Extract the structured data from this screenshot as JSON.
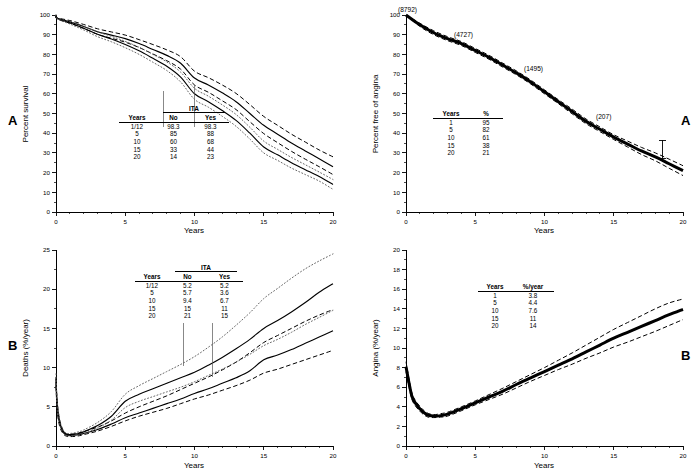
{
  "figure": {
    "panels": [
      {
        "id": "top-left",
        "letter": "A",
        "ylabel": "Percent survival",
        "xlabel": "Years",
        "table": {
          "group_header": "ITA",
          "columns": [
            "Years",
            "No",
            "Yes"
          ],
          "rows": [
            [
              "1/12",
              "98.3",
              "98.3"
            ],
            [
              "5",
              "85",
              "88"
            ],
            [
              "10",
              "60",
              "68"
            ],
            [
              "15",
              "33",
              "44"
            ],
            [
              "20",
              "14",
              "23"
            ]
          ]
        }
      },
      {
        "id": "top-right",
        "letter": "A",
        "ylabel": "Percent free of angina",
        "xlabel": "Years",
        "annotations": [
          "(8792)",
          "(4727)",
          "(1495)",
          "(207)"
        ],
        "table": {
          "columns": [
            "Years",
            "%"
          ],
          "rows": [
            [
              "1",
              "95"
            ],
            [
              "5",
              "82"
            ],
            [
              "10",
              "61"
            ],
            [
              "15",
              "38"
            ],
            [
              "20",
              "21"
            ]
          ]
        }
      },
      {
        "id": "bottom-left",
        "letter": "B",
        "ylabel": "Deaths (%/year)",
        "xlabel": "Years",
        "table": {
          "group_header": "ITA",
          "columns": [
            "Years",
            "No",
            "Yes"
          ],
          "rows": [
            [
              "1/12",
              "5.2",
              "5.2"
            ],
            [
              "5",
              "5.7",
              "3.6"
            ],
            [
              "10",
              "9.4",
              "6.7"
            ],
            [
              "15",
              "15",
              "11"
            ],
            [
              "20",
              "21",
              "15"
            ]
          ]
        }
      },
      {
        "id": "bottom-right",
        "letter": "B",
        "ylabel": "Angina (%/year)",
        "xlabel": "Years",
        "table": {
          "columns": [
            "Years",
            "%/year"
          ],
          "rows": [
            [
              "1",
              "3.8"
            ],
            [
              "5",
              "4.4"
            ],
            [
              "10",
              "7.6"
            ],
            [
              "15",
              "11"
            ],
            [
              "20",
              "14"
            ]
          ]
        }
      }
    ]
  },
  "chart_data": [
    {
      "type": "line",
      "panel": "top-left",
      "title": "",
      "xlabel": "Years",
      "ylabel": "Percent survival",
      "xlim": [
        0,
        20
      ],
      "ylim": [
        0,
        100
      ],
      "xticks": [
        0,
        5,
        10,
        15,
        20
      ],
      "yticks": [
        0,
        10,
        20,
        30,
        40,
        50,
        60,
        70,
        80,
        90,
        100
      ],
      "grid": false,
      "legend": "inset-table",
      "x": [
        0,
        0.083,
        1,
        2,
        3,
        4,
        5,
        6,
        7,
        8,
        9,
        10,
        11,
        12,
        13,
        14,
        15,
        16,
        17,
        18,
        19,
        20
      ],
      "series": [
        {
          "name": "ITA Yes (solid)",
          "style": "solid",
          "values": [
            100,
            98.3,
            96.5,
            94.2,
            91.5,
            89.8,
            88,
            85.5,
            82.5,
            79.5,
            75.5,
            68,
            64.5,
            60.5,
            56,
            50,
            44,
            39.5,
            35,
            31,
            27,
            23
          ]
        },
        {
          "name": "ITA Yes upper CL (dashed)",
          "style": "dashed",
          "values": [
            100,
            98.6,
            97.2,
            95.2,
            93,
            91.4,
            89.8,
            87.5,
            85,
            82.3,
            78.8,
            71.5,
            68.2,
            64.5,
            60.2,
            54.5,
            48.5,
            44,
            39.5,
            35.5,
            31.5,
            28
          ]
        },
        {
          "name": "ITA Yes lower CL (dashed)",
          "style": "dashed",
          "values": [
            100,
            98.0,
            95.8,
            93.2,
            90.2,
            88.2,
            86.2,
            83.5,
            80.2,
            76.8,
            72.5,
            64.5,
            60.8,
            56.5,
            52,
            45.8,
            39.8,
            35.2,
            30.8,
            26.8,
            23,
            19
          ]
        },
        {
          "name": "ITA No (solid)",
          "style": "solid",
          "values": [
            100,
            98.3,
            96.0,
            93.3,
            90.2,
            87.8,
            85,
            81.8,
            78,
            74,
            68.5,
            60,
            56,
            51.5,
            46.5,
            40,
            33,
            29,
            25,
            21.5,
            18,
            14
          ]
        },
        {
          "name": "ITA No upper CL (dotted)",
          "style": "dotted",
          "values": [
            100,
            98.5,
            96.6,
            94.2,
            91.4,
            89.2,
            86.6,
            83.6,
            80,
            76.2,
            71,
            62.8,
            58.8,
            54.4,
            49.5,
            43,
            36,
            31.8,
            27.7,
            24,
            20.3,
            16.5
          ]
        },
        {
          "name": "ITA No lower CL (dotted)",
          "style": "dotted",
          "values": [
            100,
            98.1,
            95.4,
            92.4,
            89,
            86.4,
            83.4,
            80,
            76,
            71.8,
            66,
            57.2,
            53.2,
            48.6,
            43.5,
            37,
            30,
            26.2,
            22.3,
            19,
            15.7,
            11.5
          ]
        }
      ]
    },
    {
      "type": "line",
      "panel": "top-right",
      "title": "",
      "xlabel": "Years",
      "ylabel": "Percent free of angina",
      "xlim": [
        0,
        20
      ],
      "ylim": [
        0,
        100
      ],
      "xticks": [
        0,
        5,
        10,
        15,
        20
      ],
      "yticks": [
        0,
        10,
        20,
        30,
        40,
        50,
        60,
        70,
        80,
        90,
        100
      ],
      "grid": false,
      "annotations": [
        {
          "label": "(8792)",
          "x": 0.3,
          "y": 99
        },
        {
          "label": "(4727)",
          "x": 5.2,
          "y": 87
        },
        {
          "label": "(1495)",
          "x": 9.6,
          "y": 70
        },
        {
          "label": "(207)",
          "x": 14.6,
          "y": 44
        }
      ],
      "x": [
        0,
        1,
        2,
        3,
        4,
        5,
        6,
        7,
        8,
        9,
        10,
        11,
        12,
        13,
        14,
        15,
        16,
        17,
        18,
        19,
        20
      ],
      "series": [
        {
          "name": "Percent free of angina",
          "style": "heavy-solid",
          "values": [
            100,
            95,
            91,
            88,
            85.5,
            82,
            78.5,
            74.5,
            70.5,
            66,
            61,
            56,
            51,
            46,
            42,
            38,
            34.5,
            31,
            28,
            24.5,
            21
          ]
        },
        {
          "name": "Upper confidence limit",
          "style": "dashed",
          "values": [
            100,
            95.8,
            92,
            89,
            86.5,
            83,
            79.5,
            75.5,
            71.5,
            67,
            62,
            57,
            52.2,
            47.2,
            43.2,
            39.2,
            36,
            32.8,
            30,
            26.8,
            23.5
          ]
        },
        {
          "name": "Lower confidence limit",
          "style": "dashed",
          "values": [
            100,
            94.2,
            90,
            87,
            84.5,
            81,
            77.5,
            73.5,
            69.5,
            65,
            60,
            55,
            49.8,
            44.8,
            40.8,
            36.8,
            33,
            29.2,
            26,
            22.2,
            18.5
          ]
        }
      ]
    },
    {
      "type": "line",
      "panel": "bottom-left",
      "title": "",
      "xlabel": "Years",
      "ylabel": "Deaths (%/year)",
      "xlim": [
        0,
        20
      ],
      "ylim": [
        0,
        25
      ],
      "xticks": [
        0,
        5,
        10,
        15,
        20
      ],
      "yticks": [
        0,
        5,
        10,
        15,
        20,
        25
      ],
      "grid": false,
      "legend": "inset-table",
      "x": [
        0,
        0.083,
        0.25,
        0.5,
        0.75,
        1,
        1.5,
        2,
        3,
        4,
        5,
        6,
        7,
        8,
        9,
        10,
        11,
        12,
        13,
        14,
        15,
        16,
        17,
        18,
        19,
        20
      ],
      "series": [
        {
          "name": "ITA Yes (solid)",
          "style": "solid",
          "values": [
            8.2,
            5.2,
            3.0,
            1.8,
            1.4,
            1.35,
            1.4,
            1.6,
            2.1,
            2.8,
            3.6,
            4.2,
            4.8,
            5.4,
            6.0,
            6.7,
            7.3,
            8.0,
            8.7,
            9.6,
            11.0,
            11.6,
            12.3,
            13.1,
            13.9,
            14.7
          ]
        },
        {
          "name": "ITA Yes lower CL (dashed)",
          "style": "dashed",
          "values": [
            7.6,
            4.6,
            2.6,
            1.6,
            1.25,
            1.2,
            1.25,
            1.45,
            1.9,
            2.5,
            3.2,
            3.8,
            4.3,
            4.8,
            5.4,
            6.0,
            6.5,
            7.1,
            7.7,
            8.4,
            9.3,
            9.8,
            10.4,
            11.0,
            11.6,
            12.2
          ]
        },
        {
          "name": "ITA No (solid)",
          "style": "solid",
          "values": [
            8.6,
            5.2,
            3.2,
            1.9,
            1.5,
            1.45,
            1.55,
            1.8,
            2.6,
            3.8,
            5.7,
            6.6,
            7.3,
            8.0,
            8.7,
            9.4,
            10.3,
            11.3,
            12.4,
            13.6,
            15.0,
            16.0,
            17.1,
            18.3,
            19.6,
            20.7
          ]
        },
        {
          "name": "ITA Yes upper CL (dashed)",
          "style": "dashed",
          "values": [
            8.8,
            5.8,
            3.4,
            2.0,
            1.55,
            1.5,
            1.6,
            1.85,
            2.4,
            3.2,
            4.2,
            5.0,
            5.7,
            6.4,
            7.2,
            8.0,
            8.8,
            9.7,
            10.7,
            11.9,
            13.2,
            14.1,
            15.0,
            15.9,
            16.7,
            17.4
          ]
        },
        {
          "name": "ITA No upper CL (dotted)",
          "style": "dotted",
          "values": [
            9.2,
            5.9,
            3.5,
            2.1,
            1.65,
            1.6,
            1.75,
            2.05,
            3.0,
            4.4,
            6.6,
            7.7,
            8.6,
            9.5,
            10.4,
            11.4,
            12.6,
            13.9,
            15.4,
            17.0,
            18.8,
            20.1,
            21.4,
            22.6,
            23.6,
            24.5
          ]
        },
        {
          "name": "ITA No lower CL (dotted)",
          "style": "dotted",
          "values": [
            7.9,
            4.7,
            2.9,
            1.75,
            1.35,
            1.3,
            1.4,
            1.6,
            2.3,
            3.3,
            4.9,
            5.7,
            6.3,
            6.9,
            7.5,
            8.2,
            9.0,
            9.8,
            10.7,
            11.7,
            12.8,
            13.6,
            14.5,
            15.5,
            16.4,
            17.3
          ]
        }
      ]
    },
    {
      "type": "line",
      "panel": "bottom-right",
      "title": "",
      "xlabel": "Years",
      "ylabel": "Angina (%/year)",
      "xlim": [
        0,
        20
      ],
      "ylim": [
        0,
        20
      ],
      "xticks": [
        0,
        5,
        10,
        15,
        20
      ],
      "yticks": [
        0,
        2,
        4,
        6,
        8,
        10,
        12,
        14,
        16,
        18,
        20
      ],
      "grid": false,
      "x": [
        0,
        0.25,
        0.5,
        1,
        1.5,
        2,
        2.5,
        3,
        4,
        5,
        6,
        7,
        8,
        9,
        10,
        11,
        12,
        13,
        14,
        15,
        16,
        17,
        18,
        19,
        20
      ],
      "series": [
        {
          "name": "Angina hazard",
          "style": "heavy-solid",
          "values": [
            8.1,
            6.2,
            4.8,
            3.8,
            3.2,
            3.05,
            3.1,
            3.25,
            3.8,
            4.4,
            5.0,
            5.6,
            6.3,
            6.95,
            7.6,
            8.25,
            8.9,
            9.6,
            10.3,
            11.0,
            11.6,
            12.2,
            12.8,
            13.4,
            13.95
          ]
        },
        {
          "name": "Upper confidence limit",
          "style": "dashed",
          "values": [
            8.6,
            6.6,
            5.1,
            4.05,
            3.4,
            3.2,
            3.3,
            3.45,
            4.0,
            4.6,
            5.25,
            5.9,
            6.6,
            7.3,
            8.0,
            8.75,
            9.5,
            10.3,
            11.1,
            11.9,
            12.6,
            13.3,
            14.0,
            14.6,
            15.0
          ]
        },
        {
          "name": "Lower confidence limit",
          "style": "dashed",
          "values": [
            7.6,
            5.8,
            4.5,
            3.55,
            3.0,
            2.9,
            2.95,
            3.05,
            3.6,
            4.2,
            4.75,
            5.3,
            5.95,
            6.6,
            7.2,
            7.8,
            8.35,
            8.95,
            9.5,
            10.1,
            10.6,
            11.15,
            11.7,
            12.3,
            12.9
          ]
        }
      ]
    }
  ]
}
